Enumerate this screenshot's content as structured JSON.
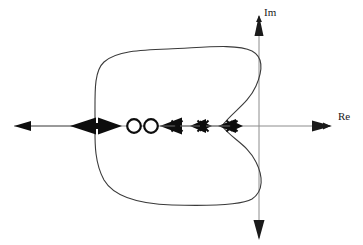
{
  "figure": {
    "type": "root-locus-complex-plane",
    "background_color": "#ffffff",
    "axes": {
      "real": {
        "label": "Re",
        "color": "#8c8c8c",
        "y": 126,
        "x_start": 14,
        "x_end": 330,
        "arrow_right": true,
        "arrow_left": true
      },
      "imaginary": {
        "label": "Im",
        "color": "#8c8c8c",
        "x": 259,
        "y_start": 238,
        "y_end": 16,
        "arrow_up": true,
        "arrow_down": true
      },
      "origin": {
        "x": 259,
        "y": 126
      }
    },
    "markers": {
      "zeros": [
        {
          "name": "zero-1",
          "symbol": "circle",
          "x": 134,
          "y": 126,
          "radius": 7
        },
        {
          "name": "zero-2",
          "symbol": "circle",
          "x": 151,
          "y": 126,
          "radius": 7
        }
      ],
      "poles": [
        {
          "name": "pole-1",
          "symbol": "x",
          "x": 177,
          "y": 126,
          "size": 7
        },
        {
          "name": "pole-2",
          "symbol": "x",
          "x": 203,
          "y": 126,
          "size": 7
        },
        {
          "name": "pole-3",
          "symbol": "x",
          "x": 232,
          "y": 126,
          "size": 7
        }
      ]
    },
    "locus_arrows": [
      {
        "name": "arrow-far-left",
        "x": 22,
        "y": 126,
        "direction": "left",
        "size": "small"
      },
      {
        "name": "arrow-breakaway-left",
        "x": 82,
        "y": 126,
        "direction": "left",
        "size": "large"
      },
      {
        "name": "arrow-breakaway-right",
        "x": 110,
        "y": 126,
        "direction": "right",
        "size": "large"
      },
      {
        "name": "arrow-toward-pole-1",
        "x": 166,
        "y": 126,
        "direction": "left",
        "size": "large"
      },
      {
        "name": "arrow-toward-pole-2",
        "x": 196,
        "y": 126,
        "direction": "left",
        "size": "medium"
      },
      {
        "name": "arrow-into-pole-2-right",
        "x": 208,
        "y": 126,
        "direction": "left",
        "size": "small"
      },
      {
        "name": "arrow-toward-pole-3",
        "x": 225,
        "y": 126,
        "direction": "left",
        "size": "medium"
      },
      {
        "name": "arrow-into-pole-3-right",
        "x": 238,
        "y": 126,
        "direction": "left",
        "size": "small"
      }
    ],
    "contour": {
      "name": "root-locus-contour",
      "color": "#3a3a3a",
      "stroke_width": 1,
      "closed": true,
      "description": "Closed loop with a leftward rounded lobe and an S-shaped notch pinching inward on the right toward the rightmost pole",
      "extents": {
        "left": 95,
        "right": 263,
        "top": 49,
        "bottom": 206
      },
      "notch_tip": {
        "x": 222,
        "y": 126
      }
    }
  }
}
